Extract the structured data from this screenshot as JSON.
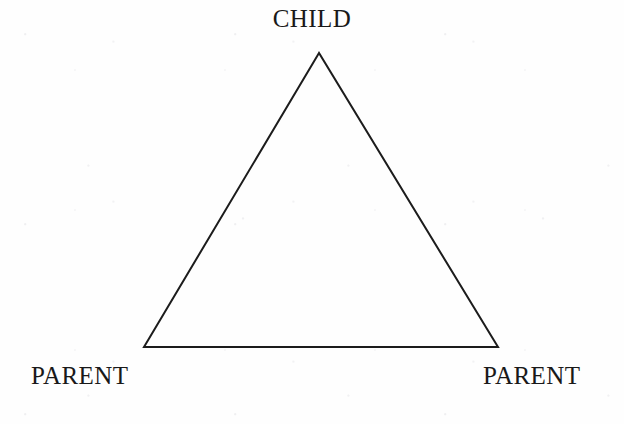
{
  "diagram": {
    "type": "triangle-relationship-diagram",
    "background_color": "#fefefe",
    "stroke_color": "#1c1c1c",
    "text_color": "#191919",
    "stroke_width": 2,
    "canvas": {
      "width": 624,
      "height": 424
    },
    "shape": {
      "name": "triangle",
      "vertices": [
        {
          "id": "apex",
          "x": 319,
          "y": 53,
          "label_ref": "child"
        },
        {
          "id": "bottom-left",
          "x": 144,
          "y": 347,
          "label_ref": "parent_left"
        },
        {
          "id": "bottom-right",
          "x": 498,
          "y": 347,
          "label_ref": "parent_right"
        }
      ],
      "points_attr": "319,53 144,347 498,347"
    },
    "labels": {
      "child": "CHILD",
      "parent_left": "PARENT",
      "parent_right": "PARENT"
    }
  }
}
